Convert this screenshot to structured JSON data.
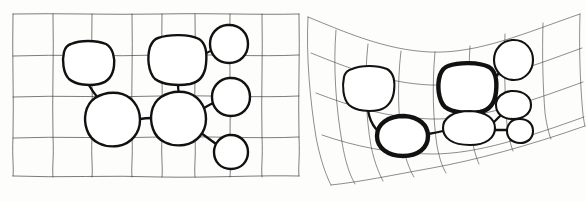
{
  "figure": {
    "style": "hand-drawn ink sketch on white paper",
    "panel_count": 2,
    "ink_color": "#111111",
    "grid_color": "#3a3a3a",
    "paper_color": "#fdfdfc"
  },
  "panels": [
    {
      "id": "left",
      "name": "regular-grid-panel",
      "caption": "",
      "grid": {
        "type": "regular",
        "columns": 8,
        "rows": 4,
        "x_lines": [
          13,
          53,
          92,
          132,
          162,
          195,
          230,
          262,
          299
        ],
        "y_lines": [
          14,
          55,
          96,
          137,
          176
        ],
        "jitter": "slight freehand waver"
      },
      "nodes": [
        {
          "id": "L1",
          "label": "",
          "shape": "rounded-square",
          "cx": 88,
          "cy": 62,
          "rx": 25,
          "ry": 21,
          "stroke": "medium"
        },
        {
          "id": "L2",
          "label": "",
          "shape": "rounded-square",
          "cx": 177,
          "cy": 60,
          "rx": 28,
          "ry": 23,
          "stroke": "medium"
        },
        {
          "id": "L3",
          "label": "",
          "shape": "circle",
          "cx": 229,
          "cy": 44,
          "rx": 19,
          "ry": 19,
          "stroke": "medium"
        },
        {
          "id": "L4",
          "label": "",
          "shape": "circle",
          "cx": 231,
          "cy": 97,
          "rx": 19,
          "ry": 19,
          "stroke": "medium"
        },
        {
          "id": "L5",
          "label": "",
          "shape": "circle",
          "cx": 113,
          "cy": 119,
          "rx": 27,
          "ry": 26,
          "stroke": "medium"
        },
        {
          "id": "L6",
          "label": "",
          "shape": "circle",
          "cx": 179,
          "cy": 118,
          "rx": 27,
          "ry": 26,
          "stroke": "medium"
        },
        {
          "id": "L7",
          "label": "",
          "shape": "circle",
          "cx": 231,
          "cy": 152,
          "rx": 17,
          "ry": 17,
          "stroke": "medium"
        }
      ],
      "edges": [
        {
          "source": "L1",
          "target": "L5"
        },
        {
          "source": "L2",
          "target": "L3"
        },
        {
          "source": "L2",
          "target": "L6"
        },
        {
          "source": "L6",
          "target": "L4"
        },
        {
          "source": "L5",
          "target": "L6"
        },
        {
          "source": "L6",
          "target": "L7"
        }
      ]
    },
    {
      "id": "right",
      "name": "warped-grid-panel",
      "caption": "",
      "grid": {
        "type": "warped",
        "columns": 8,
        "rows": 4,
        "description": "curvilinear grid sagging at the left and sweeping upward to the right",
        "jitter": "freehand curved lines"
      },
      "nodes": [
        {
          "id": "R1",
          "label": "",
          "shape": "rounded-square",
          "cx": 368,
          "cy": 88,
          "rx": 25,
          "ry": 22,
          "stroke": "medium"
        },
        {
          "id": "R2",
          "label": "",
          "shape": "rounded-square",
          "cx": 466,
          "cy": 88,
          "rx": 29,
          "ry": 24,
          "stroke": "bold"
        },
        {
          "id": "R3",
          "label": "",
          "shape": "circle",
          "cx": 513,
          "cy": 60,
          "rx": 20,
          "ry": 20,
          "stroke": "medium"
        },
        {
          "id": "R4",
          "label": "",
          "shape": "ellipse",
          "cx": 513,
          "cy": 105,
          "rx": 17,
          "ry": 14,
          "stroke": "medium"
        },
        {
          "id": "R5",
          "label": "",
          "shape": "ellipse",
          "cx": 402,
          "cy": 136,
          "rx": 26,
          "ry": 20,
          "stroke": "bold"
        },
        {
          "id": "R6",
          "label": "",
          "shape": "ellipse",
          "cx": 469,
          "cy": 128,
          "rx": 26,
          "ry": 17,
          "stroke": "medium"
        },
        {
          "id": "R7",
          "label": "",
          "shape": "circle",
          "cx": 520,
          "cy": 131,
          "rx": 12,
          "ry": 12,
          "stroke": "medium"
        }
      ],
      "edges": [
        {
          "source": "R1",
          "target": "R5"
        },
        {
          "source": "R2",
          "target": "R3"
        },
        {
          "source": "R2",
          "target": "R6"
        },
        {
          "source": "R6",
          "target": "R4"
        },
        {
          "source": "R5",
          "target": "R6"
        },
        {
          "source": "R6",
          "target": "R7"
        }
      ]
    }
  ]
}
